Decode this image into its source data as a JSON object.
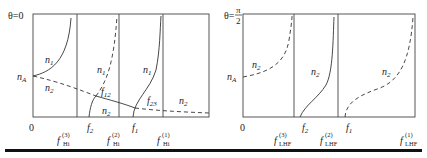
{
  "panels": [
    {
      "id": "left",
      "theta_label": "θ=0",
      "curve_labels": {
        "n1_a": "n",
        "n1_a_sub": "1",
        "n1_b": "n",
        "n1_b_sub": "1",
        "n1_c": "n",
        "n1_c_sub": "1",
        "n2_a": "n",
        "n2_a_sub": "2",
        "n2_b": "n",
        "n2_b_sub": "2",
        "n2_c": "n",
        "n2_c_sub": "2",
        "nA": "n",
        "nA_sub": "A",
        "f12": "f",
        "f12_sub": "12",
        "f23": "f",
        "f23_sub": "23"
      },
      "axis_labels": {
        "origin": "0",
        "f2": "f",
        "f2_sub": "2",
        "f1": "f",
        "f1_sub": "1",
        "fHi3": "f",
        "fHi3_sup": "(3)",
        "fHi3_sub": "Hi",
        "fHi2": "f",
        "fHi2_sup": "(2)",
        "fHi2_sub": "Hi",
        "fHi1": "f",
        "fHi1_sup": "(1)",
        "fHi1_sub": "Hi"
      }
    },
    {
      "id": "right",
      "theta_label": "θ=",
      "theta_num": "π",
      "theta_den": "2",
      "curve_labels": {
        "n2_a": "n",
        "n2_a_sub": "2",
        "n2_b": "n",
        "n2_b_sub": "2",
        "n2_c": "n",
        "n2_c_sub": "2",
        "nA": "n",
        "nA_sub": "A"
      },
      "axis_labels": {
        "origin": "0",
        "f2": "f",
        "f2_sub": "2",
        "f1": "f",
        "f1_sub": "1",
        "fLHF3": "f",
        "fLHF3_sup": "(3)",
        "fLHF3_sub": "LHF",
        "fLHF2": "f",
        "fLHF2_sup": "(2)",
        "fLHF2_sub": "LHF",
        "fLHF1": "f",
        "fLHF1_sup": "(1)",
        "fLHF1_sub": "LHF"
      }
    }
  ],
  "colors": {
    "line": "#333333",
    "rule": "#111111"
  }
}
